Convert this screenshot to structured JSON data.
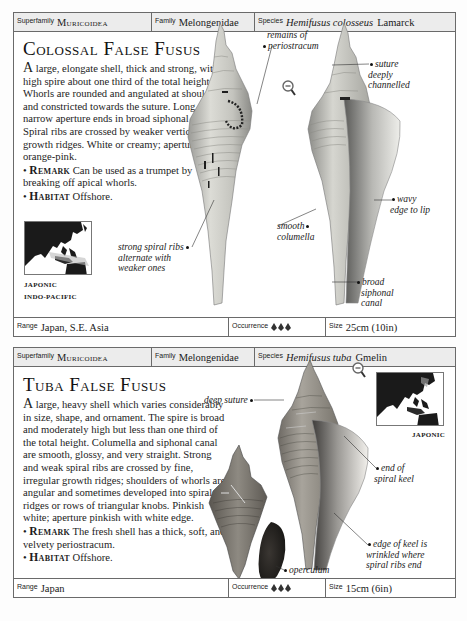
{
  "cards": [
    {
      "header": {
        "superfamily_label": "Superfamily",
        "superfamily": "Muricoidea",
        "family_label": "Family",
        "family": "Melongenidae",
        "species_label": "Species",
        "species_genus": "Hemifusus colosseus",
        "species_author": "Lamarck"
      },
      "title": "Colossal False Fusus",
      "description": {
        "dropcap": "A",
        "text": " large, elongate shell, thick and strong, with a high spire about one third of the total height. Whorls are rounded and angulated at shoulder and constricted towards the suture. Long and narrow aperture ends in broad siphonal canal. Spiral ribs are crossed by weaker vertical growth ridges. White or creamy; aperture orange-pink.",
        "remark_label": "Remark",
        "remark": " Can be used as a trumpet by breaking off apical whorls.",
        "habitat_label": "Habitat",
        "habitat": " Offshore."
      },
      "map_labels": [
        "JAPONIC",
        "INDO-PACIFIC"
      ],
      "annotations": {
        "periostracum": [
          "remains of",
          "periostracum"
        ],
        "suture": [
          "suture",
          "deeply",
          "channelled"
        ],
        "wavy": [
          "wavy",
          "edge to lip"
        ],
        "columella": [
          "smooth",
          "columella"
        ],
        "ribs": [
          "strong spiral ribs",
          "alternate with",
          "weaker ones"
        ],
        "canal": [
          "broad",
          "siphonal",
          "canal"
        ]
      },
      "footer": {
        "range_label": "Range",
        "range": "Japan, S.E. Asia",
        "occurrence_label": "Occurrence",
        "occurrence_icons": "3 shell icons",
        "size_label": "Size",
        "size": "25cm (10in)"
      }
    },
    {
      "header": {
        "superfamily_label": "Superfamily",
        "superfamily": "Muricoidea",
        "family_label": "Family",
        "family": "Melongenidae",
        "species_label": "Species",
        "species_genus": "Hemifusus tuba",
        "species_author": "Gmelin"
      },
      "title": "Tuba False Fusus",
      "description": {
        "dropcap": "A",
        "text": " large, heavy shell which varies considerably in size, shape, and ornament. The spire is broad and moderately high but less than one third of the total height. Columella and siphonal canal are smooth, glossy, and very straight. Strong and weak spiral ribs are crossed by fine, irregular growth ridges; shoulders of whorls are angular and sometimes developed into spiral ridges or rows of triangular knobs. Pinkish white; aperture pinkish with white edge.",
        "remark_label": "Remark",
        "remark": " The fresh shell has a thick, soft, and velvety periostracum.",
        "habitat_label": "Habitat",
        "habitat": " Offshore."
      },
      "map_labels": [
        "JAPONIC"
      ],
      "annotations": {
        "suture": [
          "deep suture"
        ],
        "keel_end": [
          "end of",
          "spiral keel"
        ],
        "keel_edge": [
          "edge of keel is",
          "wrinkled where",
          "spiral ribs end"
        ],
        "operculum": [
          "operculum"
        ]
      },
      "footer": {
        "range_label": "Range",
        "range": "Japan",
        "occurrence_label": "Occurrence",
        "occurrence_icons": "3 shell icons",
        "size_label": "Size",
        "size": "15cm (6in)"
      }
    }
  ]
}
